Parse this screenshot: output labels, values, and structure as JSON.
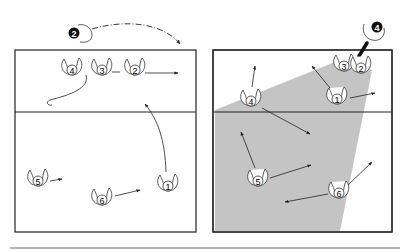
{
  "diagram": {
    "type": "volleyball-rotation-diagram",
    "colors": {
      "line": "#222222",
      "coverage_shade": "#c4c4c4",
      "background": "#ffffff",
      "footer_rule": "#9a9a9a",
      "server_fill": "#111111"
    },
    "panels": [
      {
        "id": "left",
        "court": {
          "x": 15,
          "y": 50,
          "w": 181,
          "h": 182,
          "net_y": 112
        },
        "server": {
          "label": "2",
          "x": 72,
          "y": 33
        },
        "players": [
          {
            "label": "4",
            "x": 72,
            "y": 70
          },
          {
            "label": "3",
            "x": 103,
            "y": 70
          },
          {
            "label": "2",
            "x": 135,
            "y": 70
          },
          {
            "label": "5",
            "x": 37,
            "y": 182
          },
          {
            "label": "6",
            "x": 102,
            "y": 200
          },
          {
            "label": "1",
            "x": 168,
            "y": 188
          }
        ]
      },
      {
        "id": "right",
        "court": {
          "x": 213,
          "y": 50,
          "w": 179,
          "h": 182,
          "net_y": 112
        },
        "server": {
          "label": "4",
          "x": 378,
          "y": 32
        },
        "players": [
          {
            "label": "3",
            "x": 343,
            "y": 65
          },
          {
            "label": "2",
            "x": 361,
            "y": 67
          },
          {
            "label": "4",
            "x": 251,
            "y": 100
          },
          {
            "label": "1",
            "x": 337,
            "y": 98
          },
          {
            "label": "5",
            "x": 258,
            "y": 181
          },
          {
            "label": "6",
            "x": 339,
            "y": 192
          }
        ]
      }
    ]
  }
}
